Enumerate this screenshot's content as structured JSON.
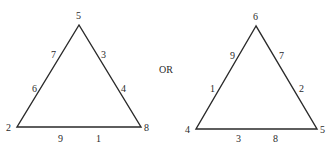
{
  "separator": "OR",
  "triangles": [
    {
      "name": "left",
      "vertices": {
        "top": "5",
        "bottom_left": "2",
        "bottom_right": "8"
      },
      "left_side": [
        "7",
        "6"
      ],
      "right_side": [
        "3",
        "4"
      ],
      "bottom_side": [
        "9",
        "1"
      ]
    },
    {
      "name": "right",
      "vertices": {
        "top": "6",
        "bottom_left": "4",
        "bottom_right": "5"
      },
      "left_side": [
        "9",
        "1"
      ],
      "right_side": [
        "7",
        "2"
      ],
      "bottom_side": [
        "3",
        "8"
      ]
    }
  ]
}
